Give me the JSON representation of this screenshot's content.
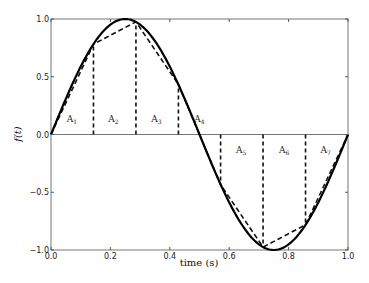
{
  "chart_data": {
    "type": "line",
    "title": "",
    "xlabel": "time (s)",
    "ylabel": "f(t)",
    "xlim": [
      0.0,
      1.0
    ],
    "ylim": [
      -1.0,
      1.0
    ],
    "x_ticks": [
      "0.0",
      "0.2",
      "0.4",
      "0.6",
      "0.8",
      "1.0"
    ],
    "y_ticks": [
      "-1.0",
      "-0.5",
      "0.0",
      "0.5",
      "1.0"
    ],
    "grid": false,
    "legend": null,
    "series": [
      {
        "name": "f(t) = sin(2πt)",
        "style": "solid",
        "color": "#000000",
        "function": "sin(2*pi*t)",
        "x": [
          0.0,
          0.05,
          0.1,
          0.15,
          0.2,
          0.25,
          0.3,
          0.35,
          0.4,
          0.45,
          0.5,
          0.55,
          0.6,
          0.65,
          0.7,
          0.75,
          0.8,
          0.85,
          0.9,
          0.95,
          1.0
        ],
        "values": [
          0.0,
          0.309,
          0.588,
          0.809,
          0.951,
          1.0,
          0.951,
          0.809,
          0.588,
          0.309,
          0.0,
          -0.309,
          -0.588,
          -0.809,
          -0.951,
          -1.0,
          -0.951,
          -0.809,
          -0.588,
          -0.309,
          0.0
        ]
      },
      {
        "name": "trapezoid approximation",
        "style": "dashed",
        "color": "#000000",
        "x": [
          0.0,
          0.143,
          0.286,
          0.429,
          0.571,
          0.714,
          0.857,
          1.0
        ],
        "values": [
          0.0,
          0.782,
          0.975,
          0.434,
          -0.434,
          -0.975,
          -0.782,
          0.0
        ]
      }
    ],
    "vertical_dashed_lines_x": [
      0.143,
      0.286,
      0.429,
      0.571,
      0.714,
      0.857
    ],
    "annotations": [
      {
        "text": "A",
        "sub": "1",
        "x": 0.07,
        "y": 0.13
      },
      {
        "text": "A",
        "sub": "2",
        "x": 0.21,
        "y": 0.13
      },
      {
        "text": "A",
        "sub": "3",
        "x": 0.355,
        "y": 0.13
      },
      {
        "text": "A",
        "sub": "4",
        "x": 0.5,
        "y": 0.13
      },
      {
        "text": "A",
        "sub": "5",
        "x": 0.64,
        "y": -0.13
      },
      {
        "text": "A",
        "sub": "6",
        "x": 0.785,
        "y": -0.13
      },
      {
        "text": "A",
        "sub": "7",
        "x": 0.925,
        "y": -0.13
      }
    ]
  },
  "plot": {
    "left": 51,
    "right": 348,
    "top": 19,
    "bottom": 250
  }
}
